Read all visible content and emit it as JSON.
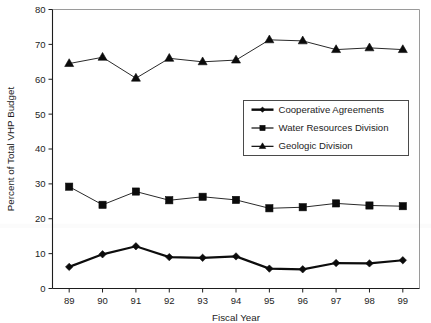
{
  "chart_data": {
    "type": "line",
    "title": "",
    "xlabel": "Fiscal Year",
    "ylabel": "Percent of Total VHP Budget",
    "categories": [
      "89",
      "90",
      "91",
      "92",
      "93",
      "94",
      "95",
      "96",
      "97",
      "98",
      "99"
    ],
    "xlim": [
      0,
      10
    ],
    "ylim": [
      0,
      80
    ],
    "yticks": [
      0,
      10,
      20,
      30,
      40,
      50,
      60,
      70,
      80
    ],
    "grid": false,
    "legend_position": "center-right",
    "series": [
      {
        "name": "Cooperative Agreements",
        "marker": "diamond",
        "line_weight": "thick",
        "values": [
          6.2,
          9.8,
          12.1,
          9.0,
          8.8,
          9.2,
          5.7,
          5.5,
          7.3,
          7.2,
          8.1
        ]
      },
      {
        "name": "Water Resources Division",
        "marker": "square",
        "line_weight": "thin",
        "values": [
          29.2,
          24.0,
          27.8,
          25.3,
          26.3,
          25.4,
          23.0,
          23.3,
          24.4,
          23.8,
          23.6
        ]
      },
      {
        "name": "Geologic Division",
        "marker": "triangle",
        "line_weight": "thin",
        "values": [
          64.5,
          66.3,
          60.3,
          66.0,
          65.0,
          65.5,
          71.3,
          71.0,
          68.5,
          69.0,
          68.5
        ]
      }
    ]
  },
  "colors": {
    "ink": "#0b0b0b",
    "axis": "#1d1d1d",
    "frame": "#9a9a9a",
    "background": "#ffffff"
  }
}
